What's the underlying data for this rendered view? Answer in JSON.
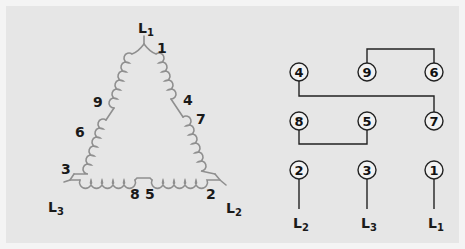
{
  "colors": {
    "background": "#f4f4f4",
    "panel": "#e6e6e6",
    "coil": "#8f8f8f",
    "wire": "#222222",
    "text": "#1a1a1a"
  },
  "delta_diagram": {
    "vertices": {
      "top": {
        "label": "L",
        "sub": "1"
      },
      "left": {
        "label": "L",
        "sub": "3"
      },
      "right": {
        "label": "L",
        "sub": "2"
      }
    },
    "winding_labels": [
      "1",
      "4",
      "7",
      "9",
      "6",
      "3",
      "8",
      "5",
      "2"
    ]
  },
  "terminal_diagram": {
    "rows": [
      [
        "4",
        "9",
        "6"
      ],
      [
        "8",
        "5",
        "7"
      ],
      [
        "2",
        "3",
        "1"
      ]
    ],
    "line_labels": [
      {
        "label": "L",
        "sub": "2"
      },
      {
        "label": "L",
        "sub": "3"
      },
      {
        "label": "L",
        "sub": "1"
      }
    ]
  }
}
